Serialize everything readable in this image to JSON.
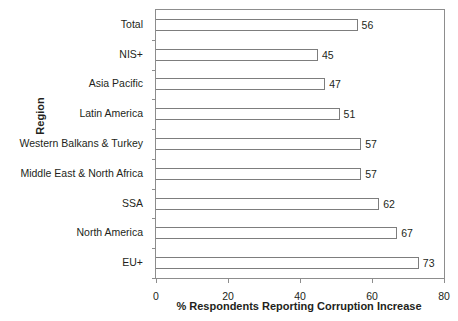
{
  "chart_data": {
    "type": "bar",
    "orientation": "horizontal",
    "title": "",
    "xlabel": "% Respondents Reporting Corruption Increase",
    "ylabel": "Region",
    "categories": [
      "Total",
      "NIS+",
      "Asia Pacific",
      "Latin America",
      "Western Balkans & Turkey",
      "Middle East & North Africa",
      "SSA",
      "North America",
      "EU+"
    ],
    "values": [
      56,
      45,
      47,
      51,
      57,
      57,
      62,
      67,
      73
    ],
    "value_labels": [
      "56",
      "45",
      "47",
      "51",
      "57",
      "57",
      "62",
      "67",
      "73"
    ],
    "xlim": [
      0,
      80
    ],
    "xticks": [
      0,
      20,
      40,
      60,
      80
    ],
    "xtick_labels": [
      "0",
      "20",
      "40",
      "60",
      "80"
    ],
    "grid": false,
    "legend": null,
    "bar_fill_color": "#ffffff",
    "bar_edge_color": "#7d7d7d",
    "axis_color": "#8d8d8d",
    "text_color": "#231f20"
  }
}
